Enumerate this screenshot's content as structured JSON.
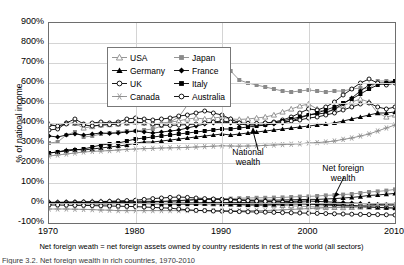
{
  "chart_data": {
    "type": "line",
    "title": "",
    "xlabel": "",
    "ylabel": "% of national income",
    "caption": "Net foreign weath = net foreign assets owned by country residents in rest of the world (all sectors)",
    "subcaption": "Figure 3.2. Net foreign wealth in rich countries, 1970-2010",
    "xlim": [
      1970,
      2010
    ],
    "ylim": [
      -100,
      900
    ],
    "ytick_labels": [
      "900%",
      "800%",
      "700%",
      "600%",
      "500%",
      "400%",
      "300%",
      "200%",
      "100%",
      "0%",
      "-100%"
    ],
    "ytick_values": [
      900,
      800,
      700,
      600,
      500,
      400,
      300,
      200,
      100,
      0,
      -100
    ],
    "xtick_labels": [
      "1970",
      "1980",
      "1990",
      "2000",
      "2010"
    ],
    "xtick_values": [
      1970,
      1980,
      1990,
      2000,
      2010
    ],
    "grid": true,
    "legend_position": "top-left",
    "annotations": [
      {
        "label": "National wealth",
        "x": 1993,
        "y": 250
      },
      {
        "label": "Net foreign wealth",
        "x": 2004,
        "y": 180
      }
    ],
    "legend": [
      {
        "name": "USA",
        "marker": "tri-open",
        "color": "#8a8a8a"
      },
      {
        "name": "Japan",
        "marker": "square",
        "color": "#8a8a8a"
      },
      {
        "name": "Germany",
        "marker": "tri-filled",
        "color": "#000000"
      },
      {
        "name": "France",
        "marker": "diamond",
        "color": "#000000"
      },
      {
        "name": "UK",
        "marker": "circ-open",
        "color": "#000000"
      },
      {
        "name": "Italy",
        "marker": "square",
        "color": "#000000"
      },
      {
        "name": "Canada",
        "marker": "star",
        "color": "#8a8a8a"
      },
      {
        "name": "Australia",
        "marker": "circ-open",
        "color": "#000000"
      }
    ],
    "x": [
      1970,
      1971,
      1972,
      1973,
      1974,
      1975,
      1976,
      1977,
      1978,
      1979,
      1980,
      1981,
      1982,
      1983,
      1984,
      1985,
      1986,
      1987,
      1988,
      1989,
      1990,
      1991,
      1992,
      1993,
      1994,
      1995,
      1996,
      1997,
      1998,
      1999,
      2000,
      2001,
      2002,
      2003,
      2004,
      2005,
      2006,
      2007,
      2008,
      2009,
      2010
    ],
    "series": [
      {
        "name": "USA national wealth",
        "group": "national",
        "marker": "tri-open",
        "color": "#8a8a8a",
        "values": [
          395,
          385,
          400,
          398,
          375,
          382,
          390,
          392,
          395,
          400,
          405,
          400,
          395,
          400,
          405,
          410,
          420,
          425,
          420,
          425,
          430,
          420,
          418,
          420,
          425,
          430,
          440,
          455,
          470,
          485,
          495,
          470,
          455,
          470,
          485,
          505,
          520,
          505,
          450,
          430,
          440
        ]
      },
      {
        "name": "Japan national wealth",
        "group": "national",
        "marker": "square",
        "color": "#8a8a8a",
        "values": [
          300,
          305,
          340,
          355,
          330,
          335,
          345,
          350,
          355,
          360,
          360,
          365,
          370,
          385,
          405,
          430,
          490,
          560,
          625,
          680,
          700,
          660,
          615,
          600,
          590,
          580,
          570,
          560,
          555,
          560,
          565,
          560,
          555,
          560,
          560,
          570,
          575,
          570,
          610,
          610,
          610
        ]
      },
      {
        "name": "Germany national wealth",
        "group": "national",
        "marker": "tri-filled",
        "color": "#000000",
        "values": [
          250,
          255,
          265,
          268,
          265,
          270,
          275,
          280,
          285,
          290,
          300,
          305,
          305,
          310,
          315,
          320,
          325,
          330,
          335,
          340,
          345,
          340,
          345,
          350,
          355,
          360,
          365,
          370,
          375,
          380,
          385,
          390,
          395,
          400,
          410,
          420,
          430,
          440,
          450,
          450,
          455
        ]
      },
      {
        "name": "France national wealth",
        "group": "national",
        "marker": "diamond",
        "color": "#000000",
        "values": [
          335,
          330,
          340,
          345,
          340,
          345,
          350,
          348,
          350,
          355,
          360,
          355,
          350,
          355,
          360,
          365,
          375,
          385,
          395,
          400,
          405,
          400,
          395,
          390,
          390,
          390,
          395,
          400,
          410,
          425,
          440,
          445,
          450,
          470,
          495,
          525,
          560,
          590,
          600,
          600,
          605
        ]
      },
      {
        "name": "UK national wealth",
        "group": "national",
        "marker": "circ-open",
        "color": "#000000",
        "values": [
          365,
          370,
          400,
          420,
          395,
          400,
          405,
          400,
          405,
          420,
          425,
          420,
          415,
          420,
          425,
          435,
          440,
          450,
          460,
          450,
          440,
          420,
          400,
          395,
          395,
          400,
          405,
          415,
          430,
          450,
          470,
          465,
          480,
          505,
          540,
          570,
          600,
          620,
          600,
          590,
          600
        ]
      },
      {
        "name": "Italy national wealth",
        "group": "national",
        "marker": "square",
        "color": "#000000",
        "values": [
          250,
          255,
          260,
          265,
          270,
          280,
          290,
          295,
          300,
          310,
          320,
          325,
          330,
          335,
          340,
          345,
          350,
          355,
          360,
          365,
          370,
          370,
          375,
          380,
          385,
          390,
          400,
          410,
          420,
          430,
          440,
          450,
          465,
          480,
          500,
          520,
          545,
          570,
          590,
          600,
          610
        ]
      },
      {
        "name": "Canada national wealth",
        "group": "national",
        "marker": "star",
        "color": "#8a8a8a",
        "values": [
          235,
          240,
          245,
          250,
          255,
          258,
          260,
          262,
          265,
          268,
          270,
          272,
          273,
          275,
          276,
          277,
          278,
          280,
          282,
          284,
          286,
          285,
          284,
          285,
          286,
          288,
          290,
          292,
          294,
          296,
          300,
          302,
          305,
          310,
          318,
          325,
          335,
          345,
          360,
          375,
          390
        ]
      },
      {
        "name": "Australia national wealth",
        "group": "national",
        "marker": "circ-open",
        "color": "#000000",
        "values": [
          390,
          385,
          395,
          400,
          390,
          385,
          390,
          392,
          395,
          400,
          405,
          400,
          395,
          390,
          388,
          390,
          392,
          395,
          400,
          405,
          410,
          405,
          400,
          398,
          398,
          400,
          402,
          405,
          410,
          415,
          425,
          430,
          440,
          450,
          465,
          480,
          495,
          500,
          480,
          470,
          480
        ]
      },
      {
        "name": "USA net foreign wealth",
        "group": "foreign",
        "marker": "tri-open",
        "color": "#8a8a8a",
        "values": [
          5,
          5,
          6,
          6,
          7,
          8,
          8,
          9,
          9,
          10,
          10,
          10,
          9,
          8,
          6,
          4,
          2,
          0,
          -2,
          -4,
          -5,
          -6,
          -7,
          -8,
          -8,
          -9,
          -10,
          -12,
          -14,
          -16,
          -18,
          -20,
          -22,
          -22,
          -23,
          -22,
          -20,
          -20,
          -22,
          -22,
          -22
        ]
      },
      {
        "name": "Japan net foreign wealth",
        "group": "foreign",
        "marker": "square",
        "color": "#8a8a8a",
        "values": [
          0,
          0,
          1,
          1,
          1,
          2,
          2,
          3,
          4,
          4,
          3,
          4,
          5,
          6,
          8,
          10,
          13,
          16,
          18,
          20,
          20,
          22,
          24,
          25,
          26,
          26,
          27,
          28,
          30,
          32,
          33,
          35,
          38,
          40,
          42,
          45,
          50,
          55,
          58,
          62,
          68
        ]
      },
      {
        "name": "Germany net foreign wealth",
        "group": "foreign",
        "marker": "tri-filled",
        "color": "#000000",
        "values": [
          2,
          2,
          3,
          3,
          4,
          5,
          5,
          6,
          7,
          7,
          6,
          6,
          7,
          8,
          10,
          12,
          15,
          17,
          18,
          20,
          20,
          18,
          16,
          15,
          14,
          14,
          14,
          15,
          16,
          17,
          18,
          18,
          20,
          22,
          25,
          28,
          32,
          38,
          40,
          44,
          48
        ]
      },
      {
        "name": "France net foreign wealth",
        "group": "foreign",
        "marker": "diamond",
        "color": "#000000",
        "values": [
          0,
          0,
          0,
          1,
          1,
          1,
          2,
          2,
          2,
          2,
          1,
          0,
          -1,
          -2,
          -2,
          -1,
          0,
          1,
          2,
          3,
          3,
          2,
          2,
          3,
          4,
          5,
          6,
          7,
          8,
          9,
          10,
          8,
          6,
          4,
          2,
          0,
          -2,
          -5,
          -8,
          -10,
          -12
        ]
      },
      {
        "name": "UK net foreign wealth",
        "group": "foreign",
        "marker": "circ-open",
        "color": "#000000",
        "values": [
          1,
          2,
          3,
          4,
          5,
          5,
          6,
          8,
          10,
          12,
          14,
          18,
          22,
          25,
          28,
          30,
          28,
          25,
          22,
          20,
          18,
          16,
          14,
          12,
          10,
          8,
          6,
          4,
          2,
          0,
          -2,
          -4,
          -6,
          -8,
          -10,
          -12,
          -14,
          -14,
          -12,
          -10,
          -10
        ]
      },
      {
        "name": "Italy net foreign wealth",
        "group": "foreign",
        "marker": "square",
        "color": "#000000",
        "values": [
          -2,
          -2,
          -2,
          -3,
          -4,
          -4,
          -5,
          -4,
          -3,
          -2,
          -2,
          -3,
          -4,
          -5,
          -5,
          -6,
          -6,
          -5,
          -4,
          -4,
          -5,
          -6,
          -8,
          -10,
          -10,
          -10,
          -8,
          -6,
          -5,
          -5,
          -6,
          -8,
          -10,
          -12,
          -14,
          -16,
          -18,
          -20,
          -22,
          -24,
          -26
        ]
      },
      {
        "name": "Canada net foreign wealth",
        "group": "foreign",
        "marker": "star",
        "color": "#8a8a8a",
        "values": [
          -30,
          -30,
          -30,
          -31,
          -32,
          -33,
          -35,
          -36,
          -38,
          -38,
          -38,
          -38,
          -38,
          -38,
          -38,
          -38,
          -38,
          -38,
          -38,
          -38,
          -38,
          -38,
          -38,
          -38,
          -38,
          -38,
          -36,
          -34,
          -32,
          -30,
          -28,
          -26,
          -24,
          -22,
          -20,
          -18,
          -16,
          -14,
          -12,
          -12,
          -12
        ]
      },
      {
        "name": "Australia net foreign wealth",
        "group": "foreign",
        "marker": "circ-open",
        "color": "#000000",
        "values": [
          -10,
          -10,
          -11,
          -12,
          -12,
          -13,
          -14,
          -15,
          -16,
          -17,
          -18,
          -20,
          -22,
          -24,
          -26,
          -30,
          -34,
          -37,
          -38,
          -40,
          -41,
          -42,
          -43,
          -44,
          -45,
          -46,
          -47,
          -48,
          -49,
          -50,
          -51,
          -52,
          -53,
          -54,
          -55,
          -56,
          -57,
          -58,
          -58,
          -59,
          -60
        ]
      }
    ]
  }
}
